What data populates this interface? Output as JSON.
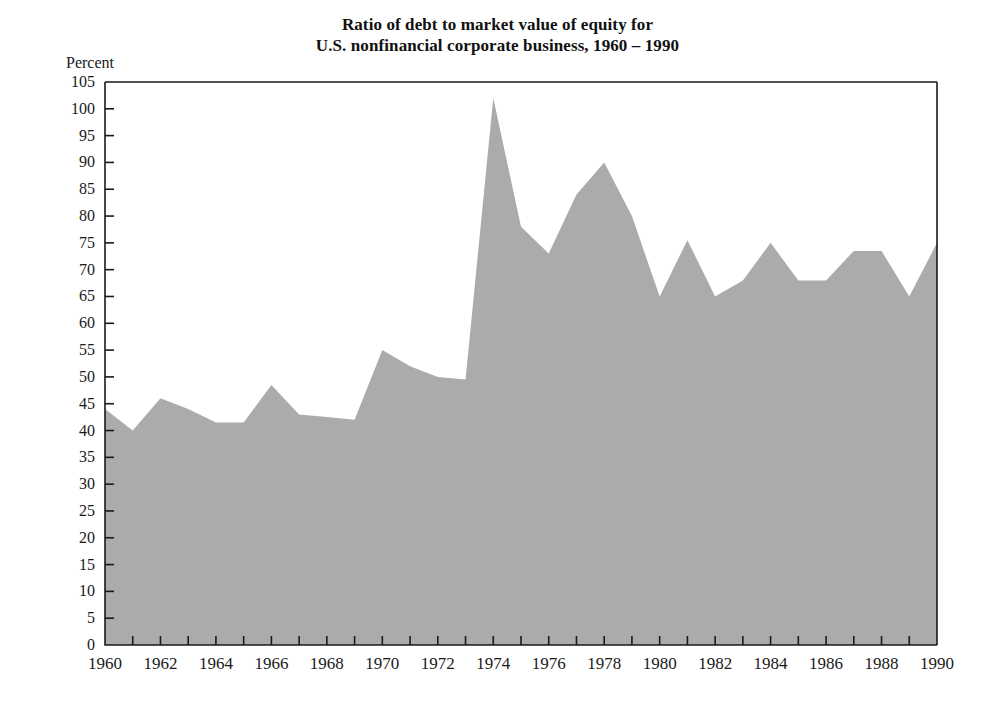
{
  "figure": {
    "title_lines": [
      "Ratio of debt to market value of equity for",
      "U.S. nonfinancial corporate business, 1960 – 1990"
    ],
    "title_full": "Ratio of debt to market value of equity for U.S. nonfinancial corporate business, 1960 – 1990",
    "unit_label": "Percent",
    "background_color": "#ffffff",
    "axis_color": "#1a1a1a",
    "area_fill_color": "#ababab"
  },
  "chart_data": {
    "type": "area",
    "title": "Ratio of debt to market value of equity for U.S. nonfinancial corporate business, 1960 – 1990",
    "xlabel": "",
    "ylabel": "Percent",
    "xlim": [
      1960,
      1990
    ],
    "ylim": [
      0,
      105
    ],
    "ytick_step": 5,
    "xtick_step": 2,
    "minor_xtick_step": 1,
    "grid": false,
    "legend": false,
    "x": [
      1960,
      1961,
      1962,
      1963,
      1964,
      1965,
      1966,
      1967,
      1968,
      1969,
      1970,
      1971,
      1972,
      1973,
      1974,
      1975,
      1976,
      1977,
      1978,
      1979,
      1980,
      1981,
      1982,
      1983,
      1984,
      1985,
      1986,
      1987,
      1988,
      1989,
      1990
    ],
    "values": [
      44,
      40,
      46,
      44,
      41.5,
      41.5,
      48.5,
      43,
      42.5,
      42,
      55,
      52,
      50,
      49.5,
      102,
      78,
      73,
      84,
      90,
      80,
      65,
      75.5,
      65,
      68,
      75,
      68,
      68,
      73.5,
      73.5,
      65,
      75
    ],
    "ytick_labels": [
      "0",
      "5",
      "10",
      "15",
      "20",
      "25",
      "30",
      "35",
      "40",
      "45",
      "50",
      "55",
      "60",
      "65",
      "70",
      "75",
      "80",
      "85",
      "90",
      "95",
      "100",
      "105"
    ],
    "xtick_labels": [
      "1960",
      "1962",
      "1964",
      "1966",
      "1968",
      "1970",
      "1972",
      "1974",
      "1976",
      "1978",
      "1980",
      "1982",
      "1984",
      "1986",
      "1988",
      "1990"
    ],
    "annotations": []
  }
}
